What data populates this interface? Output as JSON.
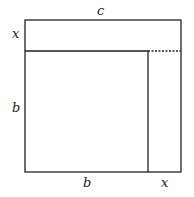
{
  "diagram": {
    "labels": {
      "top": "c",
      "left_top": "x",
      "left_bottom": "b",
      "bottom_left": "b",
      "bottom_right": "x"
    },
    "colors": {
      "stroke": "#222222",
      "background": "#ffffff"
    }
  }
}
